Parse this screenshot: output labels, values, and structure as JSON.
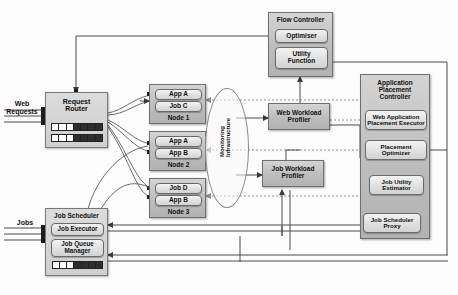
{
  "diagram": {
    "inputs": {
      "web_requests": "Web Requests",
      "jobs": "Jobs"
    },
    "request_router": {
      "title": "Request\nRouter"
    },
    "nodes": [
      {
        "name": "node-1",
        "label": "Node 1",
        "slots": [
          "App A",
          "Job C"
        ]
      },
      {
        "name": "node-2",
        "label": "Node 2",
        "slots": [
          "App A",
          "App B"
        ]
      },
      {
        "name": "node-3",
        "label": "Node 3",
        "slots": [
          "Job D",
          "App B"
        ]
      }
    ],
    "flow_controller": {
      "title": "Flow Controller",
      "optimiser": "Optimiser",
      "utility_function": "Utility\nFunction"
    },
    "web_workload_profiler": "Web Workload\nProfiler",
    "job_workload_profiler": "Job Workload\nProfiler",
    "monitoring": "Monitoring\nInfrastructure",
    "application_placement_controller": {
      "title": "Application\nPlacement\nController",
      "web_application_placement_executor": "Web Application\nPlacement Executor",
      "placement_optimizer": "Placement\nOptimizer",
      "job_utility_estimator": "Job Utility\nEstimator",
      "job_scheduler_proxy": "Job Scheduler\nProxy"
    },
    "job_scheduler": {
      "title": "Job Scheduler",
      "job_executor": "Job Executor",
      "job_queue_manager": "Job Queue\nManager"
    },
    "colors": {
      "container_grey": "#bdbdbd",
      "pill_grey": "#e2e2e2",
      "wire": "#4a4a4a",
      "dashed_wire": "#8d8d8d"
    }
  }
}
